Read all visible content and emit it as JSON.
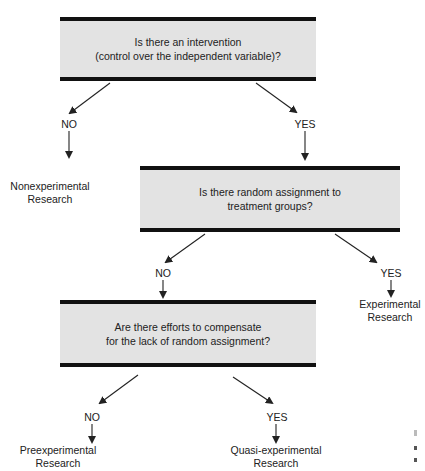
{
  "diagram": {
    "type": "decision-flowchart",
    "questions": [
      {
        "id": "q1",
        "lines": [
          "Is there an intervention",
          "(control over the independent variable)?"
        ]
      },
      {
        "id": "q2",
        "lines": [
          "Is there random assignment to",
          "treatment groups?"
        ]
      },
      {
        "id": "q3",
        "lines": [
          "Are there efforts to compensate",
          "for the lack of random assignment?"
        ]
      }
    ],
    "branch_labels": {
      "q1_no": "NO",
      "q1_yes": "YES",
      "q2_no": "NO",
      "q2_yes": "YES",
      "q3_no": "NO",
      "q3_yes": "YES"
    },
    "outcomes": {
      "nonexperimental": [
        "Nonexperimental",
        "Research"
      ],
      "experimental": [
        "Experimental",
        "Research"
      ],
      "preexperimental": [
        "Preexperimental",
        "Research"
      ],
      "quasi_experimental": [
        "Quasi-experimental",
        "Research"
      ]
    },
    "colors": {
      "box_fill": "#e3e3e3",
      "bar": "#111111",
      "arrow": "#222222"
    }
  }
}
